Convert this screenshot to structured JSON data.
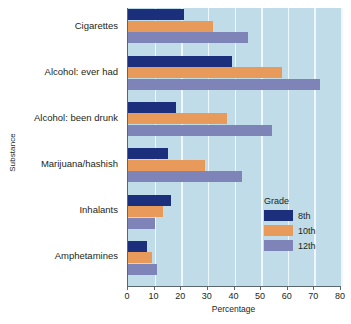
{
  "chart_data": {
    "type": "bar",
    "orientation": "horizontal",
    "title": "",
    "xlabel": "Percentage",
    "ylabel": "Substance",
    "xlim": [
      0,
      80
    ],
    "xticks": [
      0,
      10,
      20,
      30,
      40,
      50,
      60,
      70,
      80
    ],
    "grid": true,
    "legend_title": "Grade",
    "legend_position": "inside-lower-right",
    "categories": [
      "Cigarettes",
      "Alcohol: ever had",
      "Alcohol: been drunk",
      "Marijuana/hashish",
      "Inhalants",
      "Amphetamines"
    ],
    "series": [
      {
        "name": "8th",
        "color": "#1b2f7d",
        "values": [
          21,
          39,
          18,
          15,
          16,
          7
        ]
      },
      {
        "name": "10th",
        "color": "#e89a5a",
        "values": [
          32,
          58,
          37,
          29,
          13,
          9
        ]
      },
      {
        "name": "12th",
        "color": "#7e83b8",
        "values": [
          45,
          72,
          54,
          43,
          10,
          11
        ]
      }
    ]
  },
  "colors": {
    "plot_background": "#bfdce8",
    "gridline": "#eef7fb",
    "axis": "#5b6770",
    "page_background": "#ffffff",
    "text": "#231f20"
  }
}
